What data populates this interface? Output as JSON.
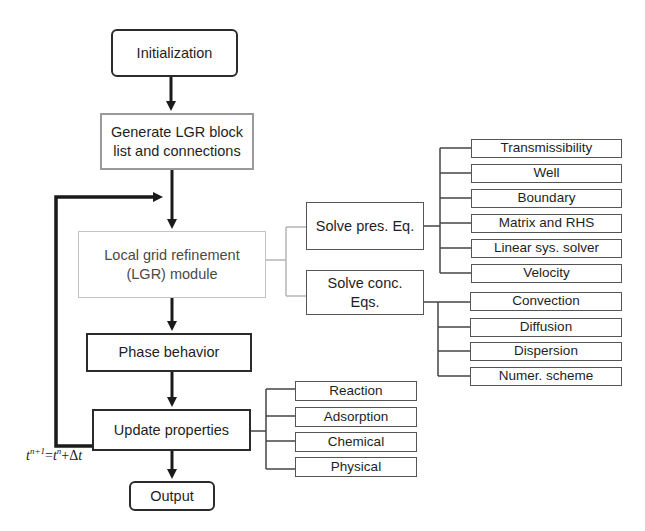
{
  "diagram": {
    "type": "flowchart",
    "main_flow": [
      {
        "id": "init",
        "label": "Initialization"
      },
      {
        "id": "gen",
        "label_line1": "Generate LGR block",
        "label_line2": "list and connections"
      },
      {
        "id": "lgr",
        "label_line1": "Local grid refinement",
        "label_line2": "(LGR) module"
      },
      {
        "id": "phase",
        "label": "Phase behavior"
      },
      {
        "id": "update",
        "label": "Update properties"
      },
      {
        "id": "output",
        "label": "Output"
      }
    ],
    "lgr_branches": [
      {
        "id": "pres",
        "label": "Solve pres. Eq."
      },
      {
        "id": "conc",
        "label_line1": "Solve conc.",
        "label_line2": "Eqs."
      }
    ],
    "pres_subitems": [
      "Transmissibility",
      "Well",
      "Boundary",
      "Matrix and RHS",
      "Linear sys. solver",
      "Velocity"
    ],
    "conc_subitems": [
      "Convection",
      "Diffusion",
      "Dispersion",
      "Numer. scheme"
    ],
    "update_subitems": [
      "Reaction",
      "Adsorption",
      "Chemical",
      "Physical"
    ],
    "loop_label": {
      "t": "t",
      "n1": "n+1",
      "eq": "=",
      "t2": "t",
      "n": "n",
      "plus": "+Δ",
      "t3": "t"
    }
  }
}
